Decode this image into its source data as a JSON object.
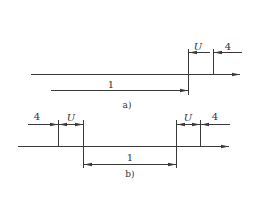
{
  "figure_a": {
    "caption": "a)",
    "labels": {
      "u": "U",
      "four": "4",
      "one": "1"
    }
  },
  "figure_b": {
    "caption": "b)",
    "labels": {
      "four_left": "4",
      "u_left": "U",
      "u_right": "U",
      "four_right": "4",
      "one": "1"
    }
  },
  "colors": {
    "line": "#3a3a3a",
    "background": "#ffffff"
  }
}
